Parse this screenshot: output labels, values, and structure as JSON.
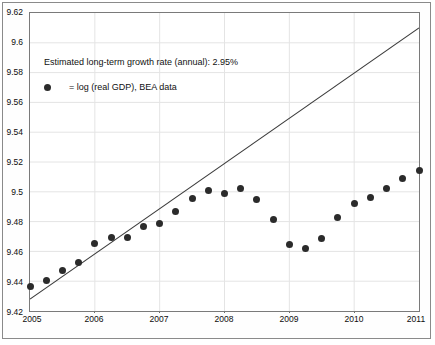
{
  "chart_data": {
    "type": "scatter",
    "title": "",
    "subtitle": "",
    "xlabel": "",
    "ylabel": "",
    "xlim": [
      2005.0,
      2011.0
    ],
    "ylim": [
      9.42,
      9.62
    ],
    "grid": true,
    "legend_position": "upper-left",
    "annotations": [
      "Estimated long-term growth rate (annual): 2.95%"
    ],
    "xticks": [
      "2005",
      "2006",
      "2007",
      "2008",
      "2009",
      "2010",
      "2011"
    ],
    "xtick_values": [
      2005,
      2006,
      2007,
      2008,
      2009,
      2010,
      2011
    ],
    "yticks": [
      "9.42",
      "9.44",
      "9.46",
      "9.48",
      "9.5",
      "9.52",
      "9.54",
      "9.56",
      "9.58",
      "9.6",
      "9.62"
    ],
    "ytick_values": [
      9.42,
      9.44,
      9.46,
      9.48,
      9.5,
      9.52,
      9.54,
      9.56,
      9.58,
      9.6,
      9.62
    ],
    "series": [
      {
        "name": "= log (real GDP), BEA data",
        "type": "scatter",
        "marker": "filled-circle",
        "color": "#2b2b2b",
        "x": [
          2005.0,
          2005.25,
          2005.5,
          2005.75,
          2006.0,
          2006.25,
          2006.5,
          2006.75,
          2007.0,
          2007.25,
          2007.5,
          2007.75,
          2008.0,
          2008.25,
          2008.5,
          2008.75,
          2009.0,
          2009.25,
          2009.5,
          2009.75,
          2010.0,
          2010.25,
          2010.5,
          2010.75,
          2011.0
        ],
        "y": [
          9.4365,
          9.4405,
          9.4475,
          9.4525,
          9.4655,
          9.469,
          9.469,
          9.4765,
          9.479,
          9.487,
          9.4955,
          9.501,
          9.499,
          9.502,
          9.495,
          9.4815,
          9.4645,
          9.462,
          9.4685,
          9.4825,
          9.492,
          9.496,
          9.502,
          9.509,
          9.514
        ]
      },
      {
        "name": "long-term trend line",
        "type": "line",
        "color": "#3a3a3a",
        "x": [
          2005.0,
          2011.0
        ],
        "y": [
          9.428,
          9.61
        ],
        "annual_growth_rate_pct": 2.95
      }
    ]
  },
  "annotation": {
    "growth_text": "Estimated long-term growth rate (annual): 2.95%"
  },
  "legend": {
    "marker_name": "filled-circle-marker",
    "label": "= log (real GDP), BEA data"
  },
  "axes": {
    "y_labels": [
      "9.62",
      "9.6",
      "9.58",
      "9.56",
      "9.54",
      "9.52",
      "9.5",
      "9.48",
      "9.46",
      "9.44",
      "9.42"
    ],
    "x_labels": [
      "2005",
      "2006",
      "2007",
      "2008",
      "2009",
      "2010",
      "2011"
    ]
  }
}
